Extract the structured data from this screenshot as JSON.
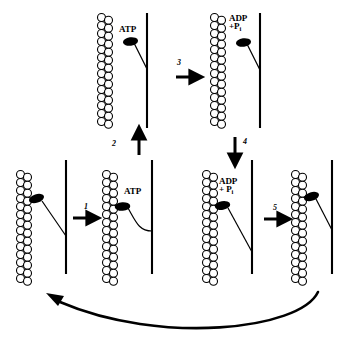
{
  "diagram": {
    "type": "biological-process-cycle",
    "colors": {
      "stroke": "#000000",
      "fill_head": "#000000",
      "fill_actin": "#ffffff",
      "background": "#ffffff"
    },
    "panels": [
      {
        "id": "panel-top-left",
        "position": "top-row-left",
        "nucleotide_label": "ATP",
        "head_state": "detached-cocked",
        "tail_shape": "straight-angled",
        "actin_beads_per_column": 13
      },
      {
        "id": "panel-top-right",
        "position": "top-row-right",
        "nucleotide_label_line1": "ADP",
        "nucleotide_label_line2_prefix": "+P",
        "nucleotide_label_line2_sub": "i",
        "head_state": "detached-cocked",
        "tail_shape": "straight-angled",
        "actin_beads_per_column": 13
      },
      {
        "id": "panel-bottom-1",
        "position": "bottom-row-1",
        "nucleotide_label": "",
        "head_state": "attached-rigor",
        "tail_shape": "straight-angled-long",
        "actin_beads_per_column": 13
      },
      {
        "id": "panel-bottom-2",
        "position": "bottom-row-2",
        "nucleotide_label": "ATP",
        "head_state": "attached-binding-atp",
        "tail_shape": "curved",
        "actin_beads_per_column": 13
      },
      {
        "id": "panel-bottom-3",
        "position": "bottom-row-3",
        "nucleotide_label_line1": "ADP",
        "nucleotide_label_line2_prefix": "+ P",
        "nucleotide_label_line2_sub": "i",
        "head_state": "attached-power-stroke",
        "tail_shape": "straight-angled-long",
        "actin_beads_per_column": 13
      },
      {
        "id": "panel-bottom-4",
        "position": "bottom-row-4",
        "nucleotide_label": "",
        "head_state": "attached-rigor",
        "tail_shape": "straight-angled",
        "actin_beads_per_column": 13
      }
    ],
    "steps": [
      {
        "number": "1",
        "direction": "right",
        "from": "panel-bottom-1",
        "to": "panel-bottom-2"
      },
      {
        "number": "2",
        "direction": "up",
        "from": "panel-bottom-2",
        "to": "panel-top-left"
      },
      {
        "number": "3",
        "direction": "right",
        "from": "panel-top-left",
        "to": "panel-top-right"
      },
      {
        "number": "4",
        "direction": "down",
        "from": "panel-top-right",
        "to": "panel-bottom-3"
      },
      {
        "number": "5",
        "direction": "right",
        "from": "panel-bottom-3",
        "to": "panel-bottom-4"
      }
    ],
    "return_arrow": {
      "name": "cycle-return-arrow",
      "direction": "right-to-left-curved",
      "from": "panel-bottom-4",
      "to": "panel-bottom-1"
    }
  }
}
